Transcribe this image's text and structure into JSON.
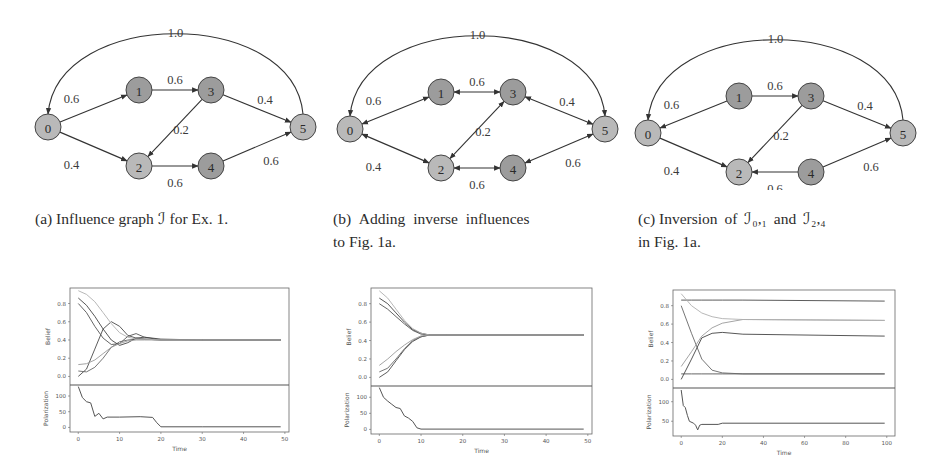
{
  "figure": {
    "subfigures": [
      {
        "id": "a",
        "caption_prefix": "(a)",
        "caption_line1": "Influence graph ℐ for Ex. 1.",
        "caption_line2": "",
        "graph": {
          "nodes": [
            {
              "id": "0",
              "x": 48,
              "y": 127,
              "shade": "light"
            },
            {
              "id": "1",
              "x": 139,
              "y": 90,
              "shade": "dark"
            },
            {
              "id": "2",
              "x": 139,
              "y": 166,
              "shade": "light"
            },
            {
              "id": "3",
              "x": 211,
              "y": 90,
              "shade": "dark"
            },
            {
              "id": "4",
              "x": 211,
              "y": 166,
              "shade": "dark"
            },
            {
              "id": "5",
              "x": 303,
              "y": 127,
              "shade": "light"
            }
          ],
          "edges": [
            {
              "from": "0",
              "to": "1",
              "weight": "0.6",
              "bidirectional": false
            },
            {
              "from": "0",
              "to": "2",
              "weight": "0.4",
              "bidirectional": false
            },
            {
              "from": "1",
              "to": "3",
              "weight": "0.6",
              "bidirectional": false
            },
            {
              "from": "3",
              "to": "2",
              "weight": "0.2",
              "bidirectional": false
            },
            {
              "from": "3",
              "to": "5",
              "weight": "0.4",
              "bidirectional": false
            },
            {
              "from": "2",
              "to": "4",
              "weight": "0.6",
              "bidirectional": false
            },
            {
              "from": "4",
              "to": "5",
              "weight": "0.6",
              "bidirectional": false
            },
            {
              "from": "5",
              "to": "0",
              "weight": "1.0",
              "bidirectional": false,
              "curved": true
            }
          ]
        }
      },
      {
        "id": "b",
        "caption_prefix": "(b)",
        "caption_line1": "Adding inverse influences",
        "caption_line2": "to Fig. 1a.",
        "graph": {
          "edges": [
            {
              "from": "0",
              "to": "1",
              "weight": "0.6",
              "bidirectional": true
            },
            {
              "from": "0",
              "to": "2",
              "weight": "0.4",
              "bidirectional": true
            },
            {
              "from": "1",
              "to": "3",
              "weight": "0.6",
              "bidirectional": true
            },
            {
              "from": "3",
              "to": "2",
              "weight": "0.2",
              "bidirectional": true
            },
            {
              "from": "3",
              "to": "5",
              "weight": "0.4",
              "bidirectional": true
            },
            {
              "from": "2",
              "to": "4",
              "weight": "0.6",
              "bidirectional": true
            },
            {
              "from": "4",
              "to": "5",
              "weight": "0.6",
              "bidirectional": true
            },
            {
              "from": "5",
              "to": "0",
              "weight": "1.0",
              "bidirectional": true,
              "curved": true
            }
          ]
        }
      },
      {
        "id": "c",
        "caption_prefix": "(c)",
        "caption_line1": "Inversion of ℐ₀,₁ and ℐ₂,₄",
        "caption_line2": "in Fig. 1a.",
        "graph": {
          "edges": [
            {
              "from": "1",
              "to": "0",
              "weight": "0.6",
              "bidirectional": false
            },
            {
              "from": "0",
              "to": "2",
              "weight": "0.4",
              "bidirectional": false
            },
            {
              "from": "1",
              "to": "3",
              "weight": "0.6",
              "bidirectional": false
            },
            {
              "from": "3",
              "to": "2",
              "weight": "0.2",
              "bidirectional": false
            },
            {
              "from": "3",
              "to": "5",
              "weight": "0.4",
              "bidirectional": false
            },
            {
              "from": "4",
              "to": "2",
              "weight": "0.6",
              "bidirectional": false
            },
            {
              "from": "4",
              "to": "5",
              "weight": "0.6",
              "bidirectional": false
            },
            {
              "from": "5",
              "to": "0",
              "weight": "1.0",
              "bidirectional": false,
              "curved": true
            }
          ]
        }
      }
    ],
    "colors": {
      "node_light": "#b9b9b9",
      "node_dark": "#9c9c9c",
      "node_stroke": "#444444",
      "edge": "#333333",
      "line": "#555555"
    }
  },
  "chart_data": [
    {
      "type": "line",
      "panel": "a",
      "title": "",
      "subplots": [
        {
          "ylabel": "Belief",
          "ylim": [
            -0.05,
            0.97
          ],
          "yticks": [
            "0.0",
            "0.2",
            "0.4",
            "0.6",
            "0.8"
          ],
          "series": [
            {
              "name": "agent 0",
              "x": [
                0,
                2,
                4,
                6,
                8,
                10,
                12,
                14,
                16,
                20,
                30,
                49
              ],
              "values": [
                0.0,
                0.08,
                0.3,
                0.52,
                0.6,
                0.55,
                0.45,
                0.42,
                0.41,
                0.4,
                0.4,
                0.4
              ]
            },
            {
              "name": "agent 1",
              "x": [
                0,
                2,
                4,
                6,
                8,
                10,
                12,
                14,
                16,
                20,
                30,
                49
              ],
              "values": [
                0.8,
                0.7,
                0.55,
                0.42,
                0.35,
                0.36,
                0.44,
                0.47,
                0.43,
                0.4,
                0.4,
                0.4
              ]
            },
            {
              "name": "agent 2",
              "x": [
                0,
                2,
                4,
                6,
                8,
                10,
                12,
                14,
                16,
                20,
                30,
                49
              ],
              "values": [
                0.06,
                0.05,
                0.1,
                0.2,
                0.32,
                0.38,
                0.4,
                0.41,
                0.41,
                0.4,
                0.4,
                0.4
              ]
            },
            {
              "name": "agent 3",
              "x": [
                0,
                2,
                4,
                6,
                8,
                10,
                12,
                14,
                16,
                20,
                30,
                49
              ],
              "values": [
                0.86,
                0.78,
                0.66,
                0.52,
                0.4,
                0.34,
                0.37,
                0.42,
                0.43,
                0.41,
                0.4,
                0.4
              ]
            },
            {
              "name": "agent 4",
              "x": [
                0,
                2,
                4,
                6,
                8,
                10,
                12,
                14,
                16,
                20,
                30,
                49
              ],
              "values": [
                0.13,
                0.14,
                0.18,
                0.25,
                0.32,
                0.36,
                0.39,
                0.4,
                0.4,
                0.4,
                0.4,
                0.4
              ]
            },
            {
              "name": "agent 5",
              "x": [
                0,
                2,
                4,
                6,
                8,
                10,
                12,
                14,
                16,
                20,
                30,
                49
              ],
              "values": [
                0.94,
                0.9,
                0.82,
                0.7,
                0.58,
                0.48,
                0.43,
                0.41,
                0.41,
                0.4,
                0.4,
                0.4
              ]
            }
          ]
        },
        {
          "ylabel": "Polarization",
          "ylim": [
            -5,
            135
          ],
          "yticks": [
            "0",
            "50",
            "100"
          ],
          "series": [
            {
              "name": "polarization",
              "x": [
                0,
                1,
                2,
                3,
                4,
                5,
                6,
                7,
                10,
                15,
                18,
                19,
                20,
                30,
                49
              ],
              "values": [
                130,
                95,
                82,
                78,
                35,
                45,
                27,
                33,
                33,
                34,
                32,
                15,
                2,
                2,
                2
              ]
            }
          ]
        }
      ],
      "xlabel": "Time",
      "xlim": [
        -2,
        51
      ],
      "xticks": [
        "0",
        "10",
        "20",
        "30",
        "40",
        "50"
      ]
    },
    {
      "type": "line",
      "panel": "b",
      "subplots": [
        {
          "ylabel": "Belief",
          "ylim": [
            -0.05,
            0.97
          ],
          "yticks": [
            "0.0",
            "0.2",
            "0.4",
            "0.6",
            "0.8"
          ],
          "series": [
            {
              "name": "agent 0",
              "x": [
                0,
                2,
                4,
                6,
                8,
                10,
                12,
                16,
                49
              ],
              "values": [
                0.0,
                0.06,
                0.18,
                0.3,
                0.39,
                0.44,
                0.46,
                0.46,
                0.46
              ]
            },
            {
              "name": "agent 1",
              "x": [
                0,
                2,
                4,
                6,
                8,
                10,
                12,
                16,
                49
              ],
              "values": [
                0.8,
                0.74,
                0.66,
                0.58,
                0.51,
                0.47,
                0.46,
                0.46,
                0.46
              ]
            },
            {
              "name": "agent 2",
              "x": [
                0,
                2,
                4,
                6,
                8,
                10,
                12,
                16,
                49
              ],
              "values": [
                0.06,
                0.1,
                0.2,
                0.31,
                0.4,
                0.44,
                0.46,
                0.46,
                0.46
              ]
            },
            {
              "name": "agent 3",
              "x": [
                0,
                2,
                4,
                6,
                8,
                10,
                12,
                16,
                49
              ],
              "values": [
                0.86,
                0.8,
                0.7,
                0.6,
                0.52,
                0.48,
                0.46,
                0.46,
                0.46
              ]
            },
            {
              "name": "agent 4",
              "x": [
                0,
                2,
                4,
                6,
                8,
                10,
                12,
                16,
                49
              ],
              "values": [
                0.13,
                0.2,
                0.28,
                0.35,
                0.41,
                0.45,
                0.46,
                0.46,
                0.46
              ]
            },
            {
              "name": "agent 5",
              "x": [
                0,
                2,
                4,
                6,
                8,
                10,
                12,
                16,
                49
              ],
              "values": [
                0.94,
                0.86,
                0.74,
                0.62,
                0.53,
                0.48,
                0.46,
                0.46,
                0.46
              ]
            }
          ]
        },
        {
          "ylabel": "Polarization",
          "ylim": [
            -5,
            135
          ],
          "yticks": [
            "0",
            "50",
            "100"
          ],
          "series": [
            {
              "name": "polarization",
              "x": [
                0,
                1,
                2,
                3,
                4,
                5,
                6,
                7,
                8,
                9,
                10,
                49
              ],
              "values": [
                130,
                100,
                88,
                78,
                68,
                65,
                42,
                35,
                25,
                5,
                1,
                1
              ]
            }
          ]
        }
      ],
      "xlabel": "Time",
      "xlim": [
        -2,
        51
      ],
      "xticks": [
        "0",
        "10",
        "20",
        "30",
        "40",
        "50"
      ]
    },
    {
      "type": "line",
      "panel": "c",
      "subplots": [
        {
          "ylabel": "Belief",
          "ylim": [
            -0.05,
            0.97
          ],
          "yticks": [
            "0.0",
            "0.2",
            "0.4",
            "0.6",
            "0.8"
          ],
          "series": [
            {
              "name": "agent 0",
              "x": [
                0,
                5,
                10,
                15,
                20,
                30,
                99
              ],
              "values": [
                0.86,
                0.86,
                0.86,
                0.86,
                0.86,
                0.86,
                0.85
              ]
            },
            {
              "name": "agent 1",
              "x": [
                0,
                5,
                10,
                15,
                20,
                30,
                99
              ],
              "values": [
                0.06,
                0.06,
                0.06,
                0.06,
                0.06,
                0.06,
                0.06
              ]
            },
            {
              "name": "agent 2",
              "x": [
                0,
                5,
                10,
                15,
                20,
                30,
                99
              ],
              "values": [
                0.8,
                0.5,
                0.22,
                0.1,
                0.07,
                0.06,
                0.06
              ]
            },
            {
              "name": "agent 3",
              "x": [
                0,
                5,
                10,
                15,
                20,
                30,
                99
              ],
              "values": [
                0.0,
                0.22,
                0.45,
                0.5,
                0.51,
                0.49,
                0.47
              ]
            },
            {
              "name": "agent 4",
              "x": [
                0,
                5,
                10,
                15,
                20,
                30,
                99
              ],
              "values": [
                0.14,
                0.3,
                0.47,
                0.56,
                0.61,
                0.65,
                0.64
              ]
            },
            {
              "name": "agent 5",
              "x": [
                0,
                5,
                10,
                15,
                20,
                30,
                99
              ],
              "values": [
                0.93,
                0.8,
                0.72,
                0.68,
                0.66,
                0.65,
                0.64
              ]
            }
          ]
        },
        {
          "ylabel": "Polarization",
          "ylim": [
            20,
            135
          ],
          "yticks": [
            "50",
            "100"
          ],
          "series": [
            {
              "name": "polarization",
              "x": [
                0,
                1,
                2,
                3,
                4,
                6,
                7,
                8,
                9,
                10,
                18,
                20,
                99
              ],
              "values": [
                130,
                90,
                85,
                65,
                50,
                45,
                40,
                28,
                40,
                42,
                42,
                45,
                45
              ]
            }
          ]
        }
      ],
      "xlabel": "Time",
      "xlim": [
        -4,
        104
      ],
      "xticks": [
        "0",
        "20",
        "40",
        "60",
        "80",
        "100"
      ]
    }
  ]
}
